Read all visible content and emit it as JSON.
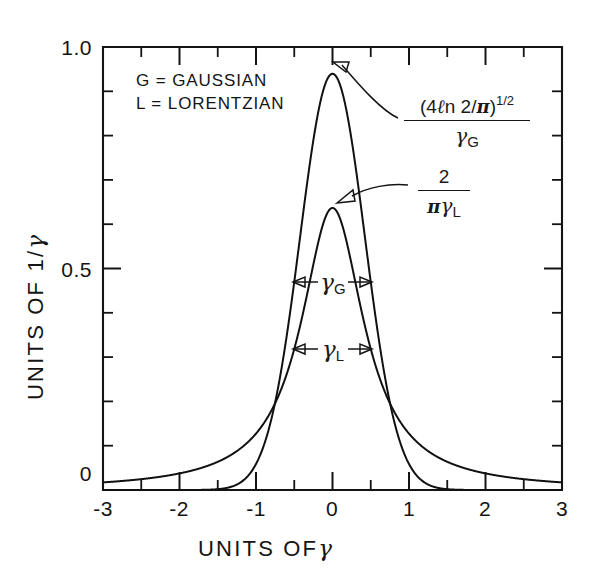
{
  "figure": {
    "background_color": "#ffffff",
    "ink_color": "#141414"
  },
  "axes": {
    "x_title": "UNITS OF",
    "x_title_symbol": "γ",
    "y_title": "UNITS OF 1/",
    "y_title_symbol": "γ",
    "x_ticks": [
      "-3",
      "-2",
      "-1",
      "0",
      "1",
      "2",
      "3"
    ],
    "y_ticks": [
      "1.0",
      "0.5",
      "0"
    ],
    "x_range": [
      -3,
      3
    ],
    "y_range": [
      0,
      1.0
    ],
    "x_minor_step": 0.5,
    "y_minor_step": 0.1
  },
  "legend": {
    "line1": "G = GAUSSIAN",
    "line2": "L = LORENTZIAN"
  },
  "annotations": {
    "gaussian_peak": {
      "numerator_prefix": "(4",
      "numerator_l": "ℓ",
      "numerator_mid": "n 2/",
      "numerator_pi": "π",
      "numerator_close": ")",
      "numerator_exponent": "1/2",
      "denominator_symbol": "γ",
      "denominator_subscript": "G",
      "full_text": "(4 ℓn 2/π)^(1/2) / γ_G",
      "points_to_value": 0.9394
    },
    "lorentzian_peak": {
      "numerator": "2",
      "denominator_pi": "π",
      "denominator_symbol": "γ",
      "denominator_subscript": "L",
      "full_text": "2 / (π γ_L)",
      "points_to_value": 0.6366
    },
    "width_gaussian": {
      "symbol": "γ",
      "subscript": "G",
      "full_text": "γ_G",
      "at_value": 0.4697,
      "span": [
        -0.5,
        0.5
      ]
    },
    "width_lorentzian": {
      "symbol": "γ",
      "subscript": "L",
      "full_text": "γ_L",
      "at_value": 0.3183,
      "span": [
        -0.5,
        0.5
      ]
    }
  },
  "chart_data": {
    "type": "line",
    "title": "",
    "xlabel": "UNITS OF γ",
    "ylabel": "UNITS OF 1/γ",
    "xlim": [
      -3,
      3
    ],
    "ylim": [
      0,
      1.0
    ],
    "grid": false,
    "legend_position": "upper-left-inside",
    "x": [
      -3.0,
      -2.8,
      -2.6,
      -2.4,
      -2.2,
      -2.0,
      -1.8,
      -1.6,
      -1.4,
      -1.2,
      -1.0,
      -0.9,
      -0.8,
      -0.7,
      -0.6,
      -0.5,
      -0.4,
      -0.3,
      -0.2,
      -0.1,
      0.0,
      0.1,
      0.2,
      0.3,
      0.4,
      0.5,
      0.6,
      0.7,
      0.8,
      0.9,
      1.0,
      1.2,
      1.4,
      1.6,
      1.8,
      2.0,
      2.2,
      2.4,
      2.6,
      2.8,
      3.0
    ],
    "series": [
      {
        "name": "G = GAUSSIAN",
        "formula": "(4 ln2/pi)^(1/2) * exp(-4 ln2 x^2)",
        "peak": 0.9394,
        "fwhm": 1.0,
        "values": [
          0.0,
          0.0,
          0.0,
          0.0,
          0.0,
          0.0,
          0.0001,
          0.0005,
          0.0019,
          0.0069,
          0.0235,
          0.0413,
          0.0691,
          0.1103,
          0.1682,
          0.2452,
          0.3409,
          0.4519,
          0.5707,
          0.686,
          0.7831,
          0.8508,
          0.8843,
          0.8843,
          0.8508,
          0.7831,
          0.686,
          0.5707,
          0.4519,
          0.3409,
          0.2452,
          0.1103,
          0.0413,
          0.0129,
          0.0034,
          0.0007,
          0.0001,
          0.0,
          0.0,
          0.0,
          0.0
        ]
      },
      {
        "name": "L = LORENTZIAN",
        "formula": "(2/pi) / (1 + 4 x^2)",
        "peak": 0.6366,
        "fwhm": 1.0,
        "values": [
          0.0172,
          0.0197,
          0.0228,
          0.0266,
          0.0314,
          0.0375,
          0.0455,
          0.0563,
          0.0712,
          0.0925,
          0.1273,
          0.1497,
          0.1789,
          0.2173,
          0.2679,
          0.3183,
          0.3873,
          0.466,
          0.5411,
          0.5973,
          0.6366,
          0.5973,
          0.5411,
          0.466,
          0.3873,
          0.3183,
          0.2679,
          0.2173,
          0.1789,
          0.1497,
          0.1273,
          0.0925,
          0.0712,
          0.0563,
          0.0455,
          0.0375,
          0.0314,
          0.0266,
          0.0228,
          0.0197,
          0.0172
        ]
      }
    ]
  }
}
